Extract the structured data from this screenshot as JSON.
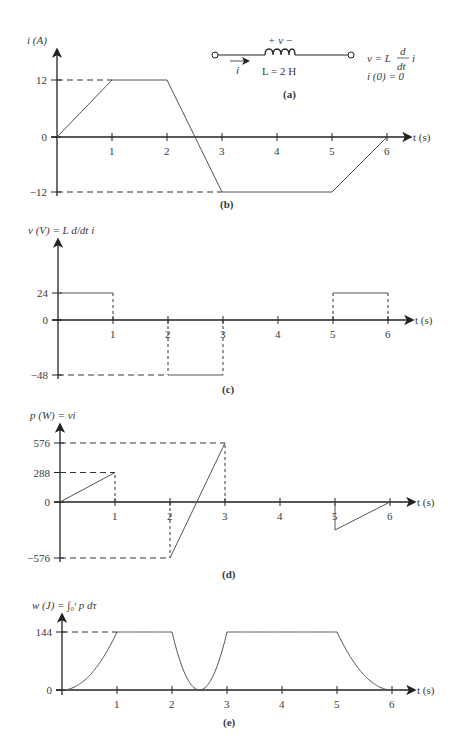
{
  "circuit": {
    "polarity": "+   v   −",
    "current_label": "i",
    "inductance_label": "L = 2 H",
    "equation": "v = L d/dt i",
    "equation_parts": {
      "v": "v = L",
      "num": "d",
      "den": "dt",
      "tail": "i"
    },
    "initial_condition": "i (0) = 0",
    "caption": "(a)"
  },
  "chart_data": [
    {
      "id": "b",
      "type": "line",
      "title": "",
      "caption": "(b)",
      "ylabel": "i (A)",
      "xlabel": "t (s)",
      "x_ticks": [
        "1",
        "2",
        "3",
        "4",
        "5",
        "6"
      ],
      "y_ticks": [
        "12",
        "0",
        "−12"
      ],
      "y_tick_values": [
        12,
        0,
        -12
      ],
      "ylim": [
        -12,
        12
      ],
      "x": [
        0,
        1,
        2,
        3,
        5,
        6
      ],
      "values": [
        0,
        12,
        12,
        -12,
        -12,
        0
      ],
      "grid": false
    },
    {
      "id": "c",
      "type": "line",
      "title": "",
      "caption": "(c)",
      "ylabel": "v (V) = L d/dt i",
      "xlabel": "t (s)",
      "x_ticks": [
        "1",
        "2",
        "3",
        "4",
        "5",
        "6"
      ],
      "y_ticks": [
        "24",
        "0",
        "−48"
      ],
      "y_tick_values": [
        24,
        0,
        -48
      ],
      "ylim": [
        -48,
        24
      ],
      "segments": [
        {
          "t0": 0,
          "t1": 1,
          "value": 24
        },
        {
          "t0": 1,
          "t1": 2,
          "value": 0
        },
        {
          "t0": 2,
          "t1": 3,
          "value": -48
        },
        {
          "t0": 3,
          "t1": 5,
          "value": 0
        },
        {
          "t0": 5,
          "t1": 6,
          "value": 24
        }
      ],
      "grid": false
    },
    {
      "id": "d",
      "type": "line",
      "title": "",
      "caption": "(d)",
      "ylabel": "p (W) = vi",
      "xlabel": "t (s)",
      "x_ticks": [
        "1",
        "2",
        "3",
        "4",
        "5",
        "6"
      ],
      "y_ticks": [
        "576",
        "288",
        "0",
        "−576"
      ],
      "y_tick_values": [
        576,
        288,
        0,
        -576
      ],
      "ylim": [
        -576,
        576
      ],
      "segments": [
        {
          "t0": 0,
          "t1": 1,
          "v0": 0,
          "v1": 288
        },
        {
          "t0": 1,
          "t1": 2,
          "v0": 0,
          "v1": 0
        },
        {
          "t0": 2,
          "t1": 3,
          "v0": -576,
          "v1": 576
        },
        {
          "t0": 3,
          "t1": 5,
          "v0": 0,
          "v1": 0
        },
        {
          "t0": 5,
          "t1": 6,
          "v0": -288,
          "v1": 0
        }
      ],
      "grid": false
    },
    {
      "id": "e",
      "type": "line",
      "title": "",
      "caption": "(e)",
      "ylabel": "w (J) = ∫₀ᵗ p dτ",
      "xlabel": "t (s)",
      "x_ticks": [
        "1",
        "2",
        "3",
        "4",
        "5",
        "6"
      ],
      "y_ticks": [
        "144",
        "0"
      ],
      "y_tick_values": [
        144,
        0
      ],
      "ylim": [
        0,
        144
      ],
      "x": [
        0,
        0.5,
        1,
        2,
        2.5,
        3,
        5,
        5.5,
        6
      ],
      "values": [
        0,
        36,
        144,
        144,
        0,
        144,
        144,
        36,
        0
      ],
      "description": "w = Li²/2: parabolic rise 0→1 s, flat 144 J 1–2 s, parabolic dip to 0 at 2.5 s and back to 144 at 3 s, flat 3–5 s, parabolic decay to 0 at 6 s",
      "grid": false
    }
  ]
}
